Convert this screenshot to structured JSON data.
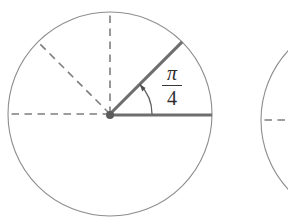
{
  "figure": {
    "canvas": {
      "width": 288,
      "height": 223
    },
    "background_color": "#ffffff",
    "stroke_colors": {
      "circle": "#8d8d8d",
      "dashed_radius": "#7e7e7e",
      "solid_radius": "#6e6e6e",
      "arc": "#5f5f5f",
      "arrow": "#4e4e4e",
      "center_dot": "#5a5a5a",
      "label_text": "#2e2e2e"
    }
  },
  "angle_label": {
    "numerator": "π",
    "denominator": "4",
    "value_text": "π/4",
    "x": 172,
    "y": 85
  },
  "primary_circle": {
    "name": "main-circle",
    "center_x": 110,
    "center_y": 114,
    "radius": 102,
    "center_dot_radius": 4,
    "radii": [
      {
        "name": "radius-0deg",
        "angle_deg": 0,
        "style": "solid",
        "label": "initial side"
      },
      {
        "name": "radius-45deg",
        "angle_deg": 45,
        "style": "solid",
        "label": "terminal side"
      },
      {
        "name": "radius-90deg",
        "angle_deg": 90,
        "style": "dashed",
        "label": "quarter turn"
      },
      {
        "name": "radius-135deg",
        "angle_deg": 135,
        "style": "dashed",
        "label": "three eighths turn"
      },
      {
        "name": "radius-180deg",
        "angle_deg": 180,
        "style": "dashed",
        "label": "half turn"
      }
    ],
    "arc": {
      "name": "angle-arc",
      "radius": 42,
      "start_angle_deg": 0,
      "end_angle_deg": 45,
      "direction": "counterclockwise",
      "arrowhead_at": "end"
    }
  },
  "secondary_circle": {
    "name": "second-circle-partial",
    "center_x": 363,
    "center_y": 120,
    "radius": 102,
    "visible_left_edge_x": 261,
    "radii": [
      {
        "name": "radius-180deg",
        "angle_deg": 180,
        "style": "dashed",
        "label": "half turn"
      }
    ]
  }
}
